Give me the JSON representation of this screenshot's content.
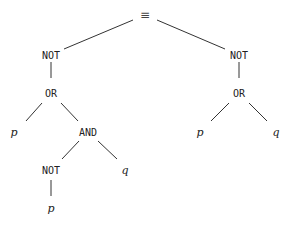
{
  "diagram": {
    "type": "expression-tree",
    "nodes": [
      {
        "id": "root",
        "label": "≡",
        "kind": "sym",
        "x": 145,
        "y": 15
      },
      {
        "id": "not-l",
        "label": "NOT",
        "kind": "op",
        "x": 51,
        "y": 55
      },
      {
        "id": "or-l",
        "label": "OR",
        "kind": "op",
        "x": 51,
        "y": 93
      },
      {
        "id": "p-1",
        "label": "p",
        "kind": "var",
        "x": 14,
        "y": 132
      },
      {
        "id": "and",
        "label": "AND",
        "kind": "op",
        "x": 88,
        "y": 132
      },
      {
        "id": "not-inner",
        "label": "NOT",
        "kind": "op",
        "x": 51,
        "y": 170
      },
      {
        "id": "q-1",
        "label": "q",
        "kind": "var",
        "x": 125,
        "y": 170
      },
      {
        "id": "p-2",
        "label": "p",
        "kind": "var",
        "x": 51,
        "y": 208
      },
      {
        "id": "not-r",
        "label": "NOT",
        "kind": "op",
        "x": 239,
        "y": 55
      },
      {
        "id": "or-r",
        "label": "OR",
        "kind": "op",
        "x": 239,
        "y": 93
      },
      {
        "id": "p-3",
        "label": "p",
        "kind": "var",
        "x": 200,
        "y": 132
      },
      {
        "id": "q-2",
        "label": "q",
        "kind": "var",
        "x": 276,
        "y": 132
      }
    ],
    "edges": [
      {
        "x1": 133,
        "y1": 20,
        "x2": 64,
        "y2": 49
      },
      {
        "x1": 157,
        "y1": 20,
        "x2": 225,
        "y2": 49
      },
      {
        "x1": 51,
        "y1": 62,
        "x2": 51,
        "y2": 78
      },
      {
        "x1": 42,
        "y1": 103,
        "x2": 26,
        "y2": 121
      },
      {
        "x1": 61,
        "y1": 103,
        "x2": 78,
        "y2": 121
      },
      {
        "x1": 79,
        "y1": 141,
        "x2": 62,
        "y2": 159
      },
      {
        "x1": 98,
        "y1": 141,
        "x2": 117,
        "y2": 159
      },
      {
        "x1": 51,
        "y1": 180,
        "x2": 51,
        "y2": 196
      },
      {
        "x1": 239,
        "y1": 62,
        "x2": 239,
        "y2": 78
      },
      {
        "x1": 229,
        "y1": 103,
        "x2": 211,
        "y2": 121
      },
      {
        "x1": 249,
        "y1": 103,
        "x2": 267,
        "y2": 121
      }
    ]
  }
}
